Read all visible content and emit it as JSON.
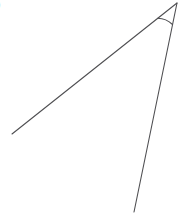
{
  "figure": {
    "label": ")",
    "background_color": "#ffffff",
    "stroke_color": "#4f4f52",
    "stroke_width": 1.1,
    "canvas": {
      "width": 191,
      "height": 216
    }
  },
  "chart_data": {
    "type": "diagram",
    "title": "",
    "subtitle": "",
    "xlabel": "",
    "ylabel": "",
    "vertex": {
      "name": "apex",
      "x": 177,
      "y": 3
    },
    "rays": [
      {
        "name": "ray-upper-left",
        "from": {
          "x": 177,
          "y": 3
        },
        "to": {
          "x": 12,
          "y": 134
        },
        "stroke": "#4f4f52"
      },
      {
        "name": "ray-lower-left",
        "from": {
          "x": 177,
          "y": 3
        },
        "to": {
          "x": 134,
          "y": 212
        },
        "stroke": "#4f4f52"
      }
    ],
    "angle_arc": {
      "name": "angle-mark",
      "center": {
        "x": 177,
        "y": 3
      },
      "radius": 22,
      "start": {
        "x": 157.7,
        "y": 18.3
      },
      "end": {
        "x": 172.5,
        "y": 24.5
      },
      "stroke": "#4f4f52"
    },
    "annotations": [
      {
        "text": ")",
        "x": 0,
        "y": 5
      }
    ],
    "grid": false,
    "legend": null
  }
}
